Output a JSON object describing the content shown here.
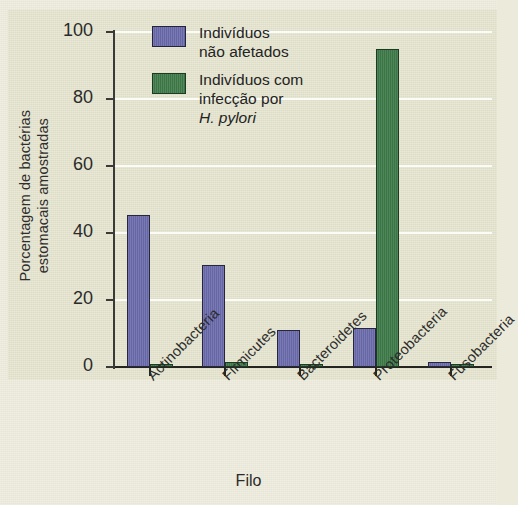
{
  "chart_data": {
    "type": "bar",
    "title": "",
    "subtitle": "",
    "xlabel": "Filo",
    "ylabel": "Porcentagem de bactérias\nestomacais amostradas",
    "categories": [
      "Actinobacteria",
      "Firmicutes",
      "Bacteroidetes",
      "Proteobacteria",
      "Fusobacteria"
    ],
    "series": [
      {
        "name": "Indivíduos não afetados",
        "color": "#6c6cad",
        "values": [
          45.5,
          30.5,
          11,
          11.5,
          1.5
        ]
      },
      {
        "name": "Indivíduos com infecção por H. pylori",
        "color": "#3e7a49",
        "values": [
          1,
          1.5,
          0.5,
          95,
          0.5
        ]
      }
    ],
    "ylim": [
      0,
      100
    ],
    "yticks": [
      0,
      20,
      40,
      60,
      80,
      100
    ],
    "ytick_labels": [
      "0",
      "20",
      "40",
      "60",
      "80",
      "100"
    ],
    "grid": "horizontal",
    "legend_position": "top-left",
    "background_color": "#e6e5cf"
  },
  "legend": {
    "entries": [
      {
        "swatch": "blue",
        "line1": "Indivíduos",
        "line2": "não afetados",
        "line3": "",
        "italic": ""
      },
      {
        "swatch": "green",
        "line1": "Indivíduos com",
        "line2": "infecção por",
        "line3": "",
        "italic": "H. pylori"
      }
    ]
  },
  "axes": {
    "x_title": "Filo",
    "y_title": "Porcentagem de bactérias\nestomacais amostradas"
  }
}
